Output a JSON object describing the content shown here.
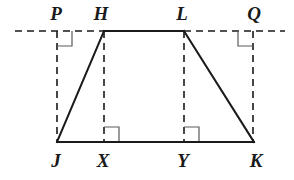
{
  "figure": {
    "kind": "geometry-diagram",
    "canvas": {
      "width": 294,
      "height": 180
    },
    "colors": {
      "stroke_solid": "#1a1a1a",
      "stroke_dashed": "#1a1a1a",
      "right_angle": "#5a5a5a",
      "background": "#ffffff",
      "label": "#1a1a1a"
    },
    "strokes": {
      "solid_width": 2,
      "dashed_width": 1.6,
      "dash_pattern": "7,5",
      "right_angle_width": 1.2
    },
    "points": {
      "P": {
        "x": 57,
        "y": 31,
        "label": "P",
        "label_x": 56,
        "label_y": 13
      },
      "H": {
        "x": 104,
        "y": 31,
        "label": "H",
        "label_x": 101,
        "label_y": 13
      },
      "L": {
        "x": 184,
        "y": 31,
        "label": "L",
        "label_x": 182,
        "label_y": 13
      },
      "Q": {
        "x": 253,
        "y": 31,
        "label": "Q",
        "label_x": 254,
        "label_y": 13
      },
      "J": {
        "x": 57,
        "y": 142,
        "label": "J",
        "label_x": 56,
        "label_y": 160
      },
      "X": {
        "x": 104,
        "y": 142,
        "label": "X",
        "label_x": 103,
        "label_y": 160
      },
      "Y": {
        "x": 184,
        "y": 142,
        "label": "Y",
        "label_x": 183,
        "label_y": 160
      },
      "K": {
        "x": 254,
        "y": 142,
        "label": "K",
        "label_x": 256,
        "label_y": 160
      }
    },
    "solid_segments": [
      {
        "name": "segment-HL",
        "from": "H",
        "to": "L",
        "x1": 104,
        "y1": 31,
        "x2": 184,
        "y2": 31
      },
      {
        "name": "segment-JH",
        "from": "J",
        "to": "H",
        "x1": 57,
        "y1": 142,
        "x2": 104,
        "y2": 31
      },
      {
        "name": "segment-LK",
        "from": "L",
        "to": "K",
        "x1": 184,
        "y1": 31,
        "x2": 254,
        "y2": 142
      },
      {
        "name": "segment-JK",
        "from": "J",
        "to": "K",
        "x1": 57,
        "y1": 142,
        "x2": 254,
        "y2": 142
      }
    ],
    "dashed_segments": [
      {
        "name": "dashed-line-PQ-left",
        "x1": 15,
        "y1": 31,
        "x2": 104,
        "y2": 31
      },
      {
        "name": "dashed-line-PQ-right",
        "x1": 184,
        "y1": 31,
        "x2": 285,
        "y2": 31
      },
      {
        "name": "dashed-altitude-PJ",
        "x1": 57,
        "y1": 31,
        "x2": 57,
        "y2": 142
      },
      {
        "name": "dashed-altitude-HX",
        "x1": 104,
        "y1": 31,
        "x2": 104,
        "y2": 142
      },
      {
        "name": "dashed-altitude-LY",
        "x1": 184,
        "y1": 31,
        "x2": 184,
        "y2": 142
      },
      {
        "name": "dashed-altitude-QK",
        "x1": 253,
        "y1": 31,
        "x2": 253,
        "y2": 142
      }
    ],
    "right_angle_marks": [
      {
        "name": "right-angle-at-P",
        "at": "P",
        "path": "M 57 46 L 72 46 L 72 31",
        "size": 15
      },
      {
        "name": "right-angle-at-Q",
        "at": "Q",
        "path": "M 253 46 L 238 46 L 238 31",
        "size": 15
      },
      {
        "name": "right-angle-at-X",
        "at": "X",
        "path": "M 104 127 L 119 127 L 119 142",
        "size": 15
      },
      {
        "name": "right-angle-at-Y",
        "at": "Y",
        "path": "M 184 127 L 199 127 L 199 142",
        "size": 15
      }
    ],
    "labels": [
      {
        "key": "P",
        "text": "P"
      },
      {
        "key": "H",
        "text": "H"
      },
      {
        "key": "L",
        "text": "L"
      },
      {
        "key": "Q",
        "text": "Q"
      },
      {
        "key": "J",
        "text": "J"
      },
      {
        "key": "X",
        "text": "X"
      },
      {
        "key": "Y",
        "text": "Y"
      },
      {
        "key": "K",
        "text": "K"
      }
    ]
  }
}
